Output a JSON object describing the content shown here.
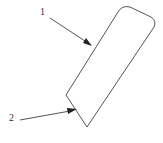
{
  "diagram": {
    "type": "patent-line-drawing",
    "colors": {
      "stroke": "#555555",
      "background": "#ffffff",
      "text": "#333333"
    },
    "labels": [
      {
        "id": "1",
        "text": "1",
        "x": 40,
        "y": 7,
        "arrow_from": [
          50,
          18
        ],
        "arrow_to": [
          92,
          46
        ]
      },
      {
        "id": "2",
        "text": "2",
        "x": 9,
        "y": 113,
        "arrow_from": [
          20,
          120
        ],
        "arrow_to": [
          76,
          110
        ]
      }
    ],
    "part": {
      "description": "slanted rounded-top rectangular plate with angled bottom",
      "vertices": [
        [
          118,
          11
        ],
        [
          128,
          6
        ],
        [
          152,
          18
        ],
        [
          155,
          26
        ],
        [
          87,
          127
        ],
        [
          66,
          95
        ]
      ]
    }
  }
}
